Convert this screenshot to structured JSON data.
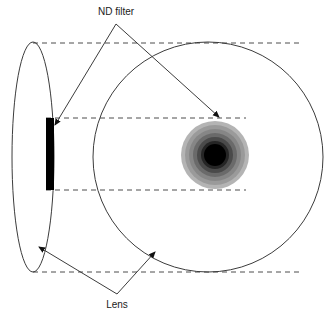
{
  "figure": {
    "background_color": "#ffffff",
    "width": 332,
    "height": 319
  },
  "labels": {
    "nd_filter": "ND filter",
    "lens": "Lens"
  },
  "shapes": {
    "lens_front_ellipse": {
      "name": "lens-front-ellipse",
      "cx": 33,
      "cy": 157,
      "rx": 21,
      "ry": 115,
      "stroke": "#3c3c3c",
      "fill": "none"
    },
    "lens_body_circle": {
      "name": "lens-body-circle",
      "cx": 208,
      "cy": 157,
      "r": 115,
      "stroke": "#3c3c3c",
      "fill": "none"
    },
    "nd_filter_rect": {
      "name": "nd-filter-rect",
      "x": 46,
      "y": 118,
      "width": 8,
      "height": 72,
      "fill": "#000000"
    },
    "spot": {
      "name": "defocused-spot",
      "cx": 215,
      "cy": 155,
      "rings": [
        {
          "r": 34,
          "color": "#b4b4b4"
        },
        {
          "r": 30,
          "color": "#9a9a9a"
        },
        {
          "r": 26,
          "color": "#868686"
        },
        {
          "r": 22,
          "color": "#6a6a6a"
        },
        {
          "r": 18,
          "color": "#4a4a4a"
        },
        {
          "r": 14,
          "color": "#252525"
        },
        {
          "r": 11,
          "color": "#000000"
        }
      ]
    }
  },
  "dashed_lines": {
    "color": "#4d4d4d",
    "dash": "5 4",
    "segments": [
      {
        "name": "top-guide",
        "x1": 33,
        "y1": 43,
        "x2": 300,
        "y2": 43
      },
      {
        "name": "upper-mid-guide",
        "x1": 46,
        "y1": 118,
        "x2": 246,
        "y2": 118
      },
      {
        "name": "lower-mid-guide",
        "x1": 46,
        "y1": 190,
        "x2": 246,
        "y2": 190
      },
      {
        "name": "bottom-guide",
        "x1": 33,
        "y1": 272,
        "x2": 300,
        "y2": 272
      }
    ]
  },
  "leaders": {
    "color": "#3c3c3c",
    "nd_filter": {
      "apex_x": 116,
      "apex_y": 24,
      "arrows": [
        {
          "name": "nd-filter-arrow-left",
          "x": 55,
          "y": 125
        },
        {
          "name": "nd-filter-arrow-right",
          "x": 219,
          "y": 117
        }
      ]
    },
    "lens": {
      "apex_x": 117,
      "apex_y": 294,
      "arrows": [
        {
          "name": "lens-arrow-left",
          "x": 39,
          "y": 247
        },
        {
          "name": "lens-arrow-right",
          "x": 155,
          "y": 252
        }
      ]
    }
  }
}
